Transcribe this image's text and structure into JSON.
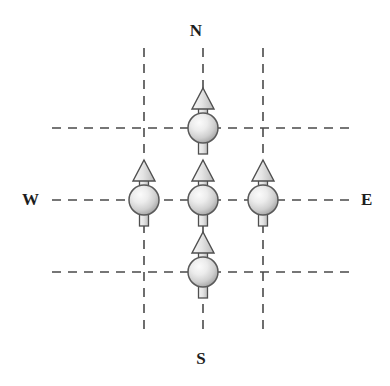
{
  "figure": {
    "kind": "spin-lattice-compass-diagram",
    "width": 390,
    "height": 386,
    "background_color": "#ffffff"
  },
  "compass": {
    "north_label": "N",
    "south_label": "S",
    "west_label": "W",
    "east_label": "E",
    "label_color": "#1d1d1d"
  },
  "grid": {
    "line_style": "dashed",
    "line_color": "#4a4a4a",
    "dash_pattern": "9 7",
    "line_width": 1.6,
    "vertical_x": [
      144,
      203,
      263
    ],
    "horizontal_y": [
      128,
      200,
      272
    ],
    "vertical_span_y": [
      48,
      330
    ],
    "horizontal_span_x": [
      52,
      352
    ]
  },
  "spins": [
    {
      "id": "spin-north",
      "x": 203,
      "y": 128,
      "direction": "up",
      "cell": "top-center"
    },
    {
      "id": "spin-west",
      "x": 144,
      "y": 200,
      "direction": "up",
      "cell": "middle-left"
    },
    {
      "id": "spin-center",
      "x": 203,
      "y": 200,
      "direction": "up",
      "cell": "middle-center"
    },
    {
      "id": "spin-east",
      "x": 263,
      "y": 200,
      "direction": "up",
      "cell": "middle-right"
    },
    {
      "id": "spin-south",
      "x": 203,
      "y": 272,
      "direction": "up",
      "cell": "bottom-center"
    }
  ],
  "spin_glyph": {
    "circle_radius": 15,
    "circle_fill_light": "#f2f2f2",
    "circle_fill_mid": "#d5d5d5",
    "circle_fill_dark": "#9a9a9a",
    "circle_stroke": "#595959",
    "arrow_head": "triangle-up",
    "arrow_head_half_width": 11,
    "arrow_head_height": 20,
    "tail_width": 9,
    "tail_height": 13,
    "stroke_color": "#4f4f4f"
  }
}
